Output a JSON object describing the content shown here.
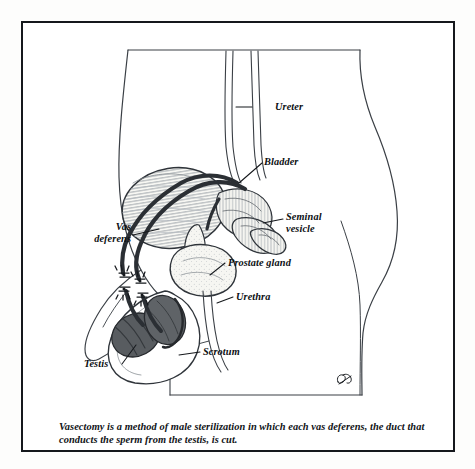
{
  "figure": {
    "caption": "Vasectomy is a method of male sterilization in which each vas deferens, the duct that conducts the sperm from the testis, is cut.",
    "signature": "artist-monogram"
  },
  "labels": [
    {
      "id": "ureter",
      "text": "Ureter",
      "x": 252,
      "y": 80,
      "align": "left"
    },
    {
      "id": "bladder",
      "text": "Bladder",
      "x": 262,
      "y": 136,
      "align": "left"
    },
    {
      "id": "seminal",
      "line1": "Seminal",
      "line2": "vesicle",
      "x": 284,
      "y": 192,
      "align": "left"
    },
    {
      "id": "vas_deferens",
      "line1": "Vas",
      "line2": "deferens",
      "x": 72,
      "y": 202,
      "align": "right"
    },
    {
      "id": "prostate",
      "text": "Prostate gland",
      "x": 226,
      "y": 236,
      "align": "left"
    },
    {
      "id": "urethra",
      "text": "Urethra",
      "x": 232,
      "y": 270,
      "align": "left"
    },
    {
      "id": "scrotum",
      "text": "Scrotum",
      "x": 200,
      "y": 325,
      "align": "left"
    },
    {
      "id": "testis",
      "text": "Testis",
      "x": 86,
      "y": 343,
      "align": "left"
    }
  ],
  "colors": {
    "frame": "#15181c",
    "ink": "#0c0f13",
    "outline": "#3a3f45",
    "vas_duct": "#2b2f34",
    "testis_fill": "#585c60",
    "bladder_fill": "#f2f2ee",
    "organ_fill": "#f4f4f0",
    "page": "#ffffff"
  }
}
